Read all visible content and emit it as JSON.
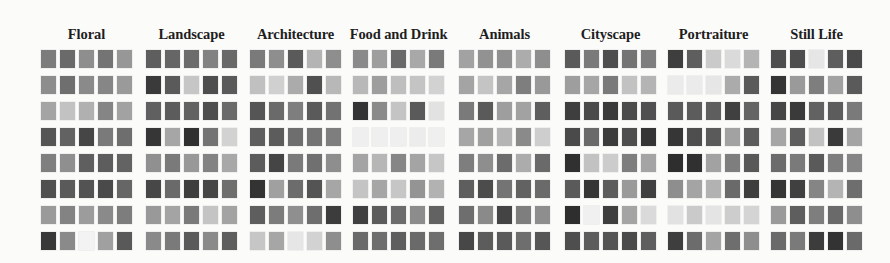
{
  "figure": {
    "panels": [
      {
        "title": "Floral",
        "left": 41,
        "rows": [
          [
            "#7c7c7c",
            "#6a6a6a",
            "#8e8e8e",
            "#747474",
            "#979797"
          ],
          [
            "#8d8d8d",
            "#6f6f6f",
            "#8a8a8a",
            "#868686",
            "#9a9a9a"
          ],
          [
            "#a4a4a4",
            "#c2c2c2",
            "#b0b0b0",
            "#858585",
            "#a2a2a2"
          ],
          [
            "#555555",
            "#626262",
            "#464646",
            "#7a7a7a",
            "#6e6e6e"
          ],
          [
            "#7f7f7f",
            "#8f8f8f",
            "#5f5f5f",
            "#5d5d5d",
            "#636363"
          ],
          [
            "#505050",
            "#5a5a5a",
            "#535353",
            "#4a4a4a",
            "#666666"
          ],
          [
            "#9a9a9a",
            "#838383",
            "#9c9c9c",
            "#8a8a8a",
            "#7d7d7d"
          ],
          [
            "#383838",
            "#8a8a8a",
            "#f3f3f3",
            "#a0a0a0",
            "#595959"
          ]
        ]
      },
      {
        "title": "Landscape",
        "left": 146,
        "rows": [
          [
            "#5e5e5e",
            "#666666",
            "#6c6c6c",
            "#828282",
            "#686868"
          ],
          [
            "#3a3a3a",
            "#5a5a5a",
            "#c6c6c6",
            "#4e4e4e",
            "#5a5a5a"
          ],
          [
            "#606060",
            "#5c5c5c",
            "#626262",
            "#4e4e4e",
            "#6a6a6a"
          ],
          [
            "#363636",
            "#a6a6a6",
            "#303030",
            "#747474",
            "#d2d2d2"
          ],
          [
            "#909090",
            "#7a7a7a",
            "#989898",
            "#838383",
            "#a8a8a8"
          ],
          [
            "#474747",
            "#6a6a6a",
            "#3e3e3e",
            "#464646",
            "#6e6e6e"
          ],
          [
            "#999999",
            "#a4a4a4",
            "#7a7a7a",
            "#c4c4c4",
            "#a3a3a3"
          ],
          [
            "#8a8a8a",
            "#7a7a7a",
            "#5a5a5a",
            "#8a8a8a",
            "#5e5e5e"
          ]
        ]
      },
      {
        "title": "Architecture",
        "left": 250,
        "rows": [
          [
            "#7a7a7a",
            "#8e8e8e",
            "#5a5a5a",
            "#b4b4b4",
            "#8e8e8e"
          ],
          [
            "#c0c0c0",
            "#d0d0d0",
            "#ababab",
            "#505050",
            "#b8b8b8"
          ],
          [
            "#555555",
            "#6a6a6a",
            "#7e7e7e",
            "#5a5a5a",
            "#727272"
          ],
          [
            "#5e5e5e",
            "#5c5c5c",
            "#6e6e6e",
            "#747474",
            "#7e7e7e"
          ],
          [
            "#5c5c5c",
            "#454545",
            "#7a7a7a",
            "#707070",
            "#8e8e8e"
          ],
          [
            "#333333",
            "#a0a0a0",
            "#6c6c6c",
            "#545454",
            "#a6a6a6"
          ],
          [
            "#5e5e5e",
            "#7c7c7c",
            "#8f8f8f",
            "#6e6e6e",
            "#3c3c3c"
          ],
          [
            "#c6c6c6",
            "#a6a6a6",
            "#e6e6e6",
            "#d2d2d2",
            "#8e8e8e"
          ]
        ]
      },
      {
        "title": "Food and Drink",
        "left": 353,
        "rows": [
          [
            "#8a8a8a",
            "#9e9e9e",
            "#6a6a6a",
            "#a8a8a8",
            "#7a7a7a"
          ],
          [
            "#b8b8b8",
            "#9e9e9e",
            "#bebebe",
            "#c4c4c4",
            "#d2d2d2"
          ],
          [
            "#343434",
            "#8a8a8a",
            "#c4c4c4",
            "#5a5a5a",
            "#e2e2e2"
          ],
          [
            "#efefef",
            "#efefef",
            "#efefef",
            "#ececec",
            "#efefef"
          ],
          [
            "#a4a4a4",
            "#b6b6b6",
            "#868686",
            "#a4a4a4",
            "#c6c6c6"
          ],
          [
            "#c4c4c4",
            "#a6a6a6",
            "#c6c6c6",
            "#949494",
            "#b2b2b2"
          ],
          [
            "#404040",
            "#5c5c5c",
            "#6c6c6c",
            "#8c8c8c",
            "#626262"
          ],
          [
            "#6a6a6a",
            "#6e6e6e",
            "#5e5e5e",
            "#6a6a6a",
            "#6e6e6e"
          ]
        ]
      },
      {
        "title": "Animals",
        "left": 459,
        "rows": [
          [
            "#a2a2a2",
            "#929292",
            "#909090",
            "#acacac",
            "#8e8e8e"
          ],
          [
            "#a4a4a4",
            "#c4c4c4",
            "#a6a6a6",
            "#7e7e7e",
            "#999999"
          ],
          [
            "#7a7a7a",
            "#5a5a5a",
            "#9e9e9e",
            "#a2a2a2",
            "#5e5e5e"
          ],
          [
            "#a6a6a6",
            "#a0a0a0",
            "#b4b4b4",
            "#8a8a8a",
            "#cecece"
          ],
          [
            "#7e7e7e",
            "#8e8e8e",
            "#6c6c6c",
            "#acacac",
            "#6a6a6a"
          ],
          [
            "#5e5e5e",
            "#4c4c4c",
            "#747474",
            "#626262",
            "#6a6a6a"
          ],
          [
            "#6e6e6e",
            "#8a8a8a",
            "#444444",
            "#7e7e7e",
            "#8e8e8e"
          ],
          [
            "#474747",
            "#5c5c5c",
            "#5a5a5a",
            "#6e6e6e",
            "#565656"
          ]
        ]
      },
      {
        "title": "Cityscape",
        "left": 565,
        "rows": [
          [
            "#5a5a5a",
            "#7a7a7a",
            "#4e4e4e",
            "#747474",
            "#7e7e7e"
          ],
          [
            "#9e9e9e",
            "#a6a6a6",
            "#7a7a7a",
            "#c2c2c2",
            "#b4b4b4"
          ],
          [
            "#3e3e3e",
            "#4a4a4a",
            "#3a3a3a",
            "#4c4c4c",
            "#505050"
          ],
          [
            "#4a4a4a",
            "#6a6a6a",
            "#3c3c3c",
            "#4e4e4e",
            "#343434"
          ],
          [
            "#303030",
            "#c2c2c2",
            "#cccccc",
            "#7e7e7e",
            "#a4a4a4"
          ],
          [
            "#5a5a5a",
            "#363636",
            "#5c5c5c",
            "#9a9a9a",
            "#404040"
          ],
          [
            "#2e2e2e",
            "#f0f0f0",
            "#3e3e3e",
            "#a4a4a4",
            "#dadada"
          ],
          [
            "#4e4e4e",
            "#5c5c5c",
            "#545454",
            "#4a4a4a",
            "#5e5e5e"
          ]
        ]
      },
      {
        "title": "Portraiture",
        "left": 668,
        "rows": [
          [
            "#3e3e3e",
            "#5e5e5e",
            "#cacaca",
            "#dadada",
            "#b4b4b4"
          ],
          [
            "#ebebeb",
            "#ebebeb",
            "#e6e6e6",
            "#ababab",
            "#5a5a5a"
          ],
          [
            "#5a5a5a",
            "#5c5c5c",
            "#5e5e5e",
            "#404040",
            "#646464"
          ],
          [
            "#363636",
            "#4e4e4e",
            "#5a5a5a",
            "#a2a2a2",
            "#5c5c5c"
          ],
          [
            "#2e2e2e",
            "#303030",
            "#a2a2a2",
            "#7e7e7e",
            "#585858"
          ],
          [
            "#8e8e8e",
            "#a4a4a4",
            "#b2b2b2",
            "#6a6a6a",
            "#3e3e3e"
          ],
          [
            "#e2e2e2",
            "#cacaca",
            "#e4e4e4",
            "#cdcdcd",
            "#d4d4d4"
          ],
          [
            "#3e3e3e",
            "#6c6c6c",
            "#a4a4a4",
            "#6e6e6e",
            "#8e8e8e"
          ]
        ]
      },
      {
        "title": "Still Life",
        "left": 771,
        "rows": [
          [
            "#4e4e4e",
            "#4e4e4e",
            "#e6e6e6",
            "#5e5e5e",
            "#4a4a4a"
          ],
          [
            "#353535",
            "#9a9a9a",
            "#7e7e7e",
            "#a2a2a2",
            "#5a5a5a"
          ],
          [
            "#464646",
            "#3a3a3a",
            "#626262",
            "#5c5c5c",
            "#7a7a7a"
          ],
          [
            "#a6a6a6",
            "#5e5e5e",
            "#c2c2c2",
            "#3a3a3a",
            "#a4a4a4"
          ],
          [
            "#6c6c6c",
            "#7a7a7a",
            "#5a5a5a",
            "#7e7e7e",
            "#868686"
          ],
          [
            "#353535",
            "#404040",
            "#858585",
            "#b4b4b4",
            "#6e6e6e"
          ],
          [
            "#9a9a9a",
            "#5e5e5e",
            "#7e7e7e",
            "#6a6a6a",
            "#8e8e8e"
          ],
          [
            "#6a6a6a",
            "#7a7a7a",
            "#3c3c3c",
            "#333333",
            "#6a6a6a"
          ]
        ]
      }
    ]
  }
}
